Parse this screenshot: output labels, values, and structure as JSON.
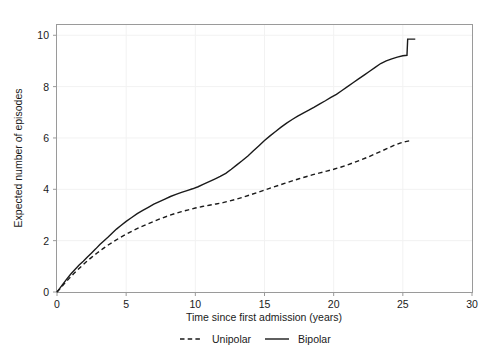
{
  "chart_data": {
    "type": "line",
    "title": "",
    "xlabel": "Time since first admission (years)",
    "ylabel": "Expected number of episodes",
    "xlim": [
      0,
      30
    ],
    "ylim": [
      0,
      10.4
    ],
    "xticks": [
      0,
      5,
      10,
      15,
      20,
      25,
      30
    ],
    "yticks": [
      0,
      2,
      4,
      6,
      8,
      10
    ],
    "xtick_labels": [
      "0",
      "5",
      "10",
      "15",
      "20",
      "25",
      "30"
    ],
    "ytick_labels": [
      "0",
      "2",
      "4",
      "6",
      "8",
      "10"
    ],
    "grid": true,
    "legend_position": "bottom-center",
    "series": [
      {
        "name": "Unipolar",
        "style": "dashed",
        "color": "#1a1a1a",
        "x": [
          0.0,
          0.2,
          0.4,
          0.6,
          0.9,
          1.2,
          1.5,
          1.8,
          2.1,
          2.5,
          2.9,
          3.3,
          3.7,
          4.1,
          4.5,
          5.0,
          5.5,
          6.0,
          6.5,
          7.0,
          7.5,
          8.0,
          8.5,
          9.0,
          9.5,
          10.0,
          10.5,
          11.0,
          11.5,
          12.0,
          12.5,
          13.0,
          13.5,
          14.0,
          14.5,
          15.0,
          15.5,
          16.0,
          16.5,
          17.0,
          17.5,
          18.0,
          18.5,
          19.0,
          19.5,
          20.0,
          20.5,
          21.0,
          21.5,
          22.0,
          22.5,
          23.0,
          23.5,
          24.0,
          24.4,
          24.8,
          25.2,
          25.6
        ],
        "y": [
          0.0,
          0.12,
          0.24,
          0.37,
          0.54,
          0.71,
          0.87,
          1.02,
          1.17,
          1.35,
          1.52,
          1.68,
          1.83,
          1.97,
          2.1,
          2.25,
          2.39,
          2.52,
          2.64,
          2.75,
          2.86,
          2.96,
          3.05,
          3.13,
          3.2,
          3.27,
          3.33,
          3.38,
          3.43,
          3.48,
          3.55,
          3.62,
          3.7,
          3.79,
          3.88,
          3.97,
          4.06,
          4.15,
          4.24,
          4.33,
          4.41,
          4.49,
          4.57,
          4.64,
          4.71,
          4.78,
          4.86,
          4.95,
          5.05,
          5.15,
          5.26,
          5.38,
          5.5,
          5.62,
          5.72,
          5.8,
          5.86,
          5.9
        ]
      },
      {
        "name": "Bipolar",
        "style": "solid",
        "color": "#1a1a1a",
        "x": [
          0.0,
          0.2,
          0.4,
          0.7,
          1.0,
          1.3,
          1.6,
          1.9,
          2.2,
          2.5,
          2.8,
          3.1,
          3.4,
          3.7,
          4.0,
          4.3,
          4.6,
          5.0,
          5.4,
          5.8,
          6.2,
          6.6,
          7.0,
          7.4,
          7.8,
          8.2,
          8.6,
          9.0,
          9.4,
          9.8,
          10.2,
          10.6,
          11.0,
          11.4,
          11.8,
          12.2,
          12.6,
          13.0,
          13.4,
          13.8,
          14.2,
          14.6,
          15.0,
          15.4,
          15.8,
          16.2,
          16.6,
          17.0,
          17.4,
          17.8,
          18.2,
          18.6,
          19.0,
          19.4,
          19.8,
          20.2,
          20.6,
          21.0,
          21.4,
          21.8,
          22.2,
          22.6,
          23.0,
          23.4,
          23.8,
          24.2,
          24.6,
          25.0,
          25.3,
          25.35,
          25.9
        ],
        "y": [
          0.0,
          0.14,
          0.29,
          0.5,
          0.7,
          0.88,
          1.05,
          1.2,
          1.36,
          1.52,
          1.68,
          1.85,
          2.0,
          2.14,
          2.3,
          2.45,
          2.58,
          2.75,
          2.9,
          3.05,
          3.18,
          3.3,
          3.42,
          3.52,
          3.62,
          3.72,
          3.8,
          3.88,
          3.95,
          4.02,
          4.1,
          4.2,
          4.3,
          4.4,
          4.5,
          4.62,
          4.78,
          4.95,
          5.12,
          5.3,
          5.5,
          5.7,
          5.9,
          6.08,
          6.25,
          6.42,
          6.58,
          6.72,
          6.85,
          6.97,
          7.08,
          7.2,
          7.33,
          7.45,
          7.58,
          7.7,
          7.85,
          8.0,
          8.15,
          8.3,
          8.45,
          8.6,
          8.75,
          8.9,
          9.0,
          9.08,
          9.15,
          9.2,
          9.22,
          9.85,
          9.85
        ]
      }
    ]
  },
  "legend": {
    "items": [
      {
        "label": "Unipolar",
        "style": "dashed"
      },
      {
        "label": "Bipolar",
        "style": "solid"
      }
    ]
  }
}
